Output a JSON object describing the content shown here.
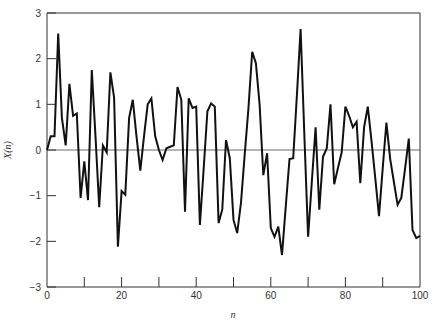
{
  "chart_data": {
    "type": "line",
    "title": "",
    "xlabel": "n",
    "ylabel": "X(n)",
    "xlim": [
      0,
      100
    ],
    "ylim": [
      -3,
      3
    ],
    "x_ticks": [
      0,
      20,
      40,
      60,
      80,
      100
    ],
    "x_minor_ticks": [
      10,
      30,
      50,
      70,
      90
    ],
    "y_ticks": [
      -3,
      -2,
      -1,
      0,
      1,
      2,
      3
    ],
    "grid": false,
    "legend": null,
    "zero_line": true,
    "series": [
      {
        "name": "X(n)",
        "color": "#111111",
        "x": [
          0,
          1,
          2,
          3,
          4,
          5,
          6,
          7,
          8,
          9,
          10,
          11,
          12,
          13,
          14,
          15,
          16,
          17,
          18,
          19,
          20,
          21,
          22,
          23,
          24,
          25,
          26,
          27,
          28,
          29,
          30,
          31,
          32,
          33,
          34,
          35,
          36,
          37,
          38,
          39,
          40,
          41,
          42,
          43,
          44,
          45,
          46,
          47,
          48,
          49,
          50,
          51,
          52,
          53,
          54,
          55,
          56,
          57,
          58,
          59,
          60,
          61,
          62,
          63,
          64,
          65,
          66,
          67,
          68,
          69,
          70,
          71,
          72,
          73,
          74,
          75,
          76,
          77,
          78,
          79,
          80,
          81,
          82,
          83,
          84,
          85,
          86,
          87,
          88,
          89,
          90,
          91,
          92,
          93,
          94,
          95,
          96,
          97,
          98,
          99,
          100
        ],
        "values": [
          0,
          0.3,
          0.3,
          2.55,
          0.7,
          0.1,
          1.45,
          0.75,
          0.8,
          -1.05,
          -0.25,
          -1.1,
          1.75,
          0.3,
          -1.25,
          0.1,
          -0.05,
          1.7,
          1.15,
          -2.12,
          -0.9,
          -0.98,
          0.7,
          1.1,
          0.3,
          -0.45,
          0.3,
          1.0,
          1.13,
          0.3,
          0.0,
          -0.22,
          0.04,
          0.07,
          0.1,
          1.38,
          1.1,
          -1.35,
          1.13,
          0.92,
          0.95,
          -1.64,
          -0.4,
          0.85,
          1.02,
          0.95,
          -1.6,
          -1.3,
          0.22,
          -0.18,
          -1.53,
          -1.82,
          -1.15,
          -0.1,
          0.9,
          2.15,
          1.9,
          1.0,
          -0.55,
          -0.07,
          -1.71,
          -1.9,
          -1.68,
          -2.3,
          -1.25,
          -0.2,
          -0.18,
          1.2,
          2.65,
          0.3,
          -1.9,
          -0.7,
          0.5,
          -1.31,
          -0.15,
          0.04,
          1.0,
          -0.75,
          -0.4,
          -0.05,
          0.95,
          0.75,
          0.5,
          0.62,
          -0.73,
          0.5,
          0.95,
          0.2,
          -0.6,
          -1.45,
          -0.4,
          0.6,
          -0.2,
          -0.7,
          -1.2,
          -1.05,
          -0.4,
          0.25,
          -1.75,
          -1.93,
          -1.88
        ]
      }
    ]
  },
  "labels": {
    "xlabel": "n",
    "ylabel": "X(n)"
  }
}
